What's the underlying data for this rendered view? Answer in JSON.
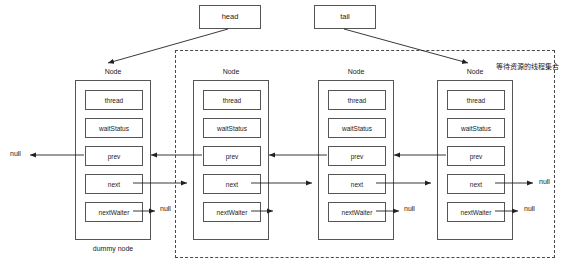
{
  "diagram": {
    "title_text": "AQS CLH queue structure",
    "pointers": [
      {
        "id": "head",
        "label": "head",
        "x": 199,
        "y": 5
      },
      {
        "id": "tail",
        "label": "tail",
        "x": 314,
        "y": 5
      }
    ],
    "field_labels": {
      "thread": "thread",
      "waitStatus": "waitStatus",
      "prev": "prev",
      "next": "next",
      "nextWaiter": "nextWaiter"
    },
    "node_caption": "Node",
    "nodes": [
      {
        "index": 0,
        "caption": "Node",
        "sub_caption": "dummy node",
        "x": 75,
        "y": 80,
        "fields": [
          "thread",
          "waitStatus",
          "prev",
          "next",
          "nextWaiter"
        ]
      },
      {
        "index": 1,
        "caption": "Node",
        "sub_caption": "",
        "x": 193,
        "y": 80,
        "fields": [
          "thread",
          "waitStatus",
          "prev",
          "next",
          "nextWaiter"
        ]
      },
      {
        "index": 2,
        "caption": "Node",
        "sub_caption": "",
        "x": 318,
        "y": 80,
        "fields": [
          "thread",
          "waitStatus",
          "prev",
          "next",
          "nextWaiter"
        ]
      },
      {
        "index": 3,
        "caption": "Node",
        "sub_caption": "",
        "x": 437,
        "y": 80,
        "fields": [
          "thread",
          "waitStatus",
          "prev",
          "next",
          "nextWaiter"
        ]
      }
    ],
    "dummy_node_caption": "dummy node",
    "null_labels": [
      {
        "id": "null-head-prev",
        "text": "null",
        "x": 10,
        "y": 150
      },
      {
        "id": "null-n0-waiter",
        "text": "null",
        "x": 160,
        "y": 205
      },
      {
        "id": "null-n2-waiter",
        "text": "null",
        "x": 404,
        "y": 205
      },
      {
        "id": "null-n3-next",
        "text": "null",
        "x": 539,
        "y": 178
      },
      {
        "id": "null-n3-waiter",
        "text": "null",
        "x": 524,
        "y": 205
      }
    ],
    "waiting_set_label": "等待资源的线程集合",
    "dashed_region": {
      "x": 175,
      "y": 50,
      "width": 380,
      "height": 208
    },
    "colors": {
      "stroke": "#555555",
      "arrow": "#222222",
      "dashed": "#4a4a4a",
      "background": "#ffffff",
      "text": "#1a1a1a"
    }
  }
}
